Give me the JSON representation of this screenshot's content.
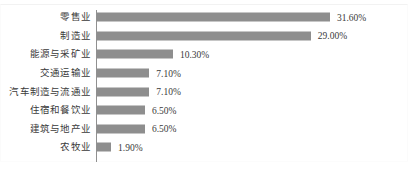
{
  "chart_data": {
    "type": "bar",
    "orientation": "horizontal",
    "title": "",
    "subtitle": "",
    "xlabel": "",
    "ylabel": "",
    "grid": false,
    "legend": "none",
    "xlim": [
      0,
      35
    ],
    "value_suffix": "%",
    "bar_color": "#8e8e8e",
    "axis_color": "#909090",
    "text_color": "#3a3a3a",
    "categories": [
      "零售业",
      "制造业",
      "能源与采矿业",
      "交通运输业",
      "汽车制造与流通业",
      "住宿和餐饮业",
      "建筑与地产业",
      "农牧业"
    ],
    "values": [
      31.6,
      29.0,
      10.3,
      7.1,
      7.1,
      6.5,
      6.5,
      1.9
    ],
    "value_labels": [
      "31.60%",
      "29.00%",
      "10.30%",
      "7.10%",
      "7.10%",
      "6.50%",
      "6.50%",
      "1.90%"
    ],
    "bars": [
      {
        "category": "零售业",
        "value": 31.6,
        "label": "31.60%"
      },
      {
        "category": "制造业",
        "value": 29.0,
        "label": "29.00%"
      },
      {
        "category": "能源与采矿业",
        "value": 10.3,
        "label": "10.30%"
      },
      {
        "category": "交通运输业",
        "value": 7.1,
        "label": "7.10%"
      },
      {
        "category": "汽车制造与流通业",
        "value": 7.1,
        "label": "7.10%"
      },
      {
        "category": "住宿和餐饮业",
        "value": 6.5,
        "label": "6.50%"
      },
      {
        "category": "建筑与地产业",
        "value": 6.5,
        "label": "6.50%"
      },
      {
        "category": "农牧业",
        "value": 1.9,
        "label": "1.90%"
      }
    ]
  }
}
